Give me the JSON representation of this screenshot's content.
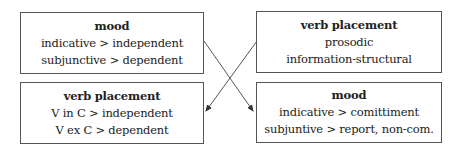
{
  "diagram": {
    "boxes": {
      "top_left": {
        "title": "mood",
        "lines": [
          "indicative > independent",
          "subjunctive > dependent"
        ]
      },
      "top_right": {
        "title": "verb placement",
        "lines": [
          "prosodic",
          "information-structural"
        ]
      },
      "bottom_left": {
        "title": "verb placement",
        "lines": [
          "V in C > independent",
          "V ex C > dependent"
        ]
      },
      "bottom_right": {
        "title": "mood",
        "lines": [
          "indicative > comittiment",
          "subjuntive > report, non-com."
        ]
      }
    },
    "arrows": [
      {
        "from": "top_left",
        "to": "bottom_right"
      },
      {
        "from": "top_right",
        "to": "bottom_left"
      }
    ],
    "colors": {
      "line": "#555555",
      "text": "#222222",
      "background": "#ffffff"
    }
  }
}
